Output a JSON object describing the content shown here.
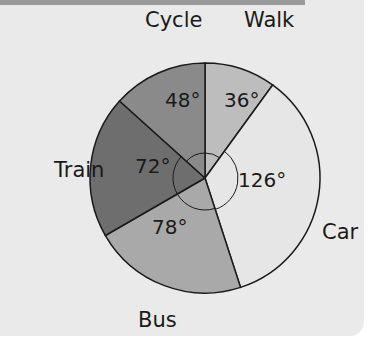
{
  "chart_data": {
    "type": "pie",
    "title": "",
    "categories": [
      "Walk",
      "Car",
      "Bus",
      "Train",
      "Cycle"
    ],
    "values": [
      36,
      126,
      78,
      72,
      48
    ],
    "unit": "degrees",
    "angle_labels": [
      "36°",
      "126°",
      "78°",
      "72°",
      "48°"
    ],
    "colors": [
      "#bdbdbd",
      "#e6e6e6",
      "#a9a9a9",
      "#6e6e6e",
      "#8a8a8a"
    ],
    "start_angle": "12 o'clock, clockwise",
    "legend": "none (labels outside slices)"
  }
}
